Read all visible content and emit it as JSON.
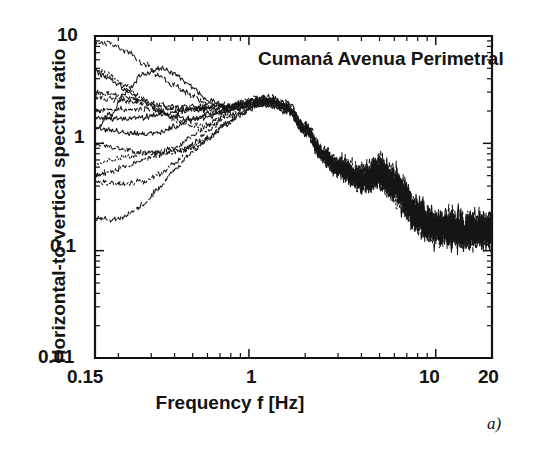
{
  "figure": {
    "caption": "a)",
    "annotation": "Cumaná Avenua Perimetral"
  },
  "chart_data": {
    "type": "line",
    "title": "Cumaná Avenua Perimetral",
    "xlabel": "Frequency f [Hz]",
    "ylabel": "Horizontal-to-vertical spectral ratio",
    "xscale": "log",
    "yscale": "log",
    "xlim": [
      0.15,
      20
    ],
    "ylim": [
      0.01,
      10
    ],
    "grid": false,
    "legend": "none",
    "xticks": [
      0.15,
      1,
      10,
      20
    ],
    "xtick_labels": [
      "0.15",
      "1",
      "10",
      "20"
    ],
    "yticks": [
      0.01,
      0.1,
      1,
      10
    ],
    "ytick_labels": [
      "0.01",
      "0.1",
      "1",
      "10"
    ],
    "n_series": 14,
    "x": [
      0.15,
      0.18,
      0.22,
      0.27,
      0.33,
      0.4,
      0.5,
      0.6,
      0.75,
      0.9,
      1.1,
      1.3,
      1.6,
      2.0,
      2.5,
      3.0,
      4.0,
      5.0,
      6.0,
      8.0,
      10.0,
      13.0,
      16.0,
      20.0
    ],
    "series": [
      {
        "name": "rec-01",
        "style": "solid",
        "values": [
          1.3,
          1.75,
          2.9,
          4.3,
          5.0,
          4.6,
          3.5,
          2.7,
          2.25,
          2.15,
          2.35,
          2.45,
          2.2,
          1.4,
          0.8,
          0.62,
          0.48,
          0.52,
          0.4,
          0.22,
          0.17,
          0.16,
          0.15,
          0.16
        ]
      },
      {
        "name": "rec-02",
        "style": "solid",
        "values": [
          4.6,
          4.0,
          3.2,
          2.55,
          2.1,
          1.85,
          1.7,
          1.75,
          1.95,
          2.2,
          2.45,
          2.4,
          2.1,
          1.35,
          0.78,
          0.58,
          0.45,
          0.55,
          0.42,
          0.21,
          0.17,
          0.15,
          0.16,
          0.15
        ]
      },
      {
        "name": "rec-03",
        "style": "solid",
        "values": [
          1.8,
          1.78,
          1.8,
          1.82,
          1.85,
          1.9,
          2.0,
          2.05,
          2.1,
          2.2,
          2.35,
          2.3,
          2.05,
          1.3,
          0.75,
          0.6,
          0.47,
          0.5,
          0.38,
          0.2,
          0.16,
          0.16,
          0.15,
          0.15
        ]
      },
      {
        "name": "rec-04",
        "style": "solid",
        "values": [
          1.45,
          1.35,
          1.25,
          1.18,
          1.2,
          1.35,
          1.62,
          1.85,
          2.05,
          2.2,
          2.4,
          2.35,
          2.05,
          1.32,
          0.76,
          0.57,
          0.46,
          0.51,
          0.39,
          0.21,
          0.17,
          0.15,
          0.15,
          0.16
        ]
      },
      {
        "name": "rec-05",
        "style": "dashed",
        "values": [
          8.6,
          8.2,
          7.0,
          5.4,
          4.2,
          3.4,
          2.8,
          2.45,
          2.3,
          2.35,
          2.6,
          2.7,
          2.35,
          1.45,
          0.82,
          0.63,
          0.5,
          0.58,
          0.43,
          0.22,
          0.17,
          0.16,
          0.16,
          0.15
        ]
      },
      {
        "name": "rec-06",
        "style": "dashed",
        "values": [
          2.55,
          2.5,
          2.45,
          2.4,
          2.35,
          2.3,
          2.3,
          2.28,
          2.3,
          2.4,
          2.55,
          2.55,
          2.25,
          1.4,
          0.8,
          0.6,
          0.48,
          0.54,
          0.41,
          0.21,
          0.16,
          0.15,
          0.16,
          0.15
        ]
      },
      {
        "name": "rec-07",
        "style": "dashed",
        "values": [
          2.05,
          2.1,
          2.15,
          2.18,
          2.15,
          2.1,
          2.08,
          2.1,
          2.15,
          2.25,
          2.45,
          2.45,
          2.15,
          1.36,
          0.77,
          0.58,
          0.46,
          0.52,
          0.4,
          0.2,
          0.16,
          0.16,
          0.15,
          0.15
        ]
      },
      {
        "name": "rec-08",
        "style": "dashed",
        "values": [
          0.21,
          0.2,
          0.22,
          0.27,
          0.38,
          0.55,
          0.8,
          1.05,
          1.45,
          1.85,
          2.3,
          2.55,
          2.3,
          1.45,
          0.83,
          0.62,
          0.49,
          0.56,
          0.42,
          0.22,
          0.17,
          0.15,
          0.16,
          0.16
        ]
      },
      {
        "name": "rec-09",
        "style": "dotted",
        "values": [
          5.0,
          4.3,
          3.3,
          2.5,
          1.95,
          1.6,
          1.45,
          1.5,
          1.75,
          2.05,
          2.4,
          2.45,
          2.15,
          1.38,
          0.79,
          0.59,
          0.47,
          0.53,
          0.4,
          0.21,
          0.16,
          0.16,
          0.15,
          0.15
        ]
      },
      {
        "name": "rec-10",
        "style": "dotted",
        "values": [
          0.62,
          0.66,
          0.72,
          0.78,
          0.82,
          0.85,
          0.95,
          1.15,
          1.55,
          1.95,
          2.35,
          2.45,
          2.15,
          1.36,
          0.78,
          0.59,
          0.46,
          0.52,
          0.39,
          0.2,
          0.16,
          0.15,
          0.15,
          0.16
        ]
      },
      {
        "name": "rec-11",
        "style": "dashdot",
        "values": [
          0.95,
          0.92,
          0.88,
          0.85,
          0.86,
          0.95,
          1.2,
          1.5,
          1.9,
          2.15,
          2.4,
          2.4,
          2.1,
          1.34,
          0.77,
          0.58,
          0.46,
          0.53,
          0.4,
          0.21,
          0.16,
          0.16,
          0.16,
          0.15
        ]
      },
      {
        "name": "rec-12",
        "style": "dashdot",
        "values": [
          0.45,
          0.44,
          0.44,
          0.46,
          0.52,
          0.66,
          0.95,
          1.25,
          1.7,
          2.0,
          2.35,
          2.4,
          2.1,
          1.33,
          0.76,
          0.57,
          0.45,
          0.51,
          0.39,
          0.2,
          0.16,
          0.15,
          0.15,
          0.15
        ]
      },
      {
        "name": "rec-13",
        "style": "dashdot",
        "values": [
          0.52,
          0.56,
          0.62,
          0.7,
          0.76,
          0.8,
          0.9,
          1.1,
          1.5,
          1.9,
          2.3,
          2.42,
          2.12,
          1.35,
          0.78,
          0.58,
          0.46,
          0.54,
          0.41,
          0.21,
          0.17,
          0.16,
          0.15,
          0.16
        ]
      },
      {
        "name": "rec-14",
        "style": "dashdot",
        "values": [
          2.9,
          2.75,
          2.55,
          2.35,
          2.2,
          2.1,
          2.05,
          2.08,
          2.15,
          2.28,
          2.5,
          2.52,
          2.22,
          1.42,
          0.81,
          0.61,
          0.49,
          0.57,
          0.43,
          0.22,
          0.17,
          0.16,
          0.16,
          0.15
        ]
      }
    ]
  },
  "axes_geometry": {
    "left_px": 95,
    "right_px": 492,
    "top_px": 36,
    "bottom_px": 358
  }
}
